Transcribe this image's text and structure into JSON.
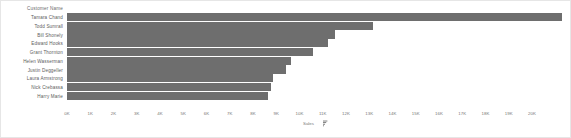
{
  "card": {
    "border_color": "#e6e6e6",
    "background": "#ffffff"
  },
  "header": {
    "label": "Customer Name"
  },
  "axis": {
    "title": "Sales",
    "sort_icon": "sort-descending-icon",
    "ticks": [
      "0K",
      "1K",
      "2K",
      "3K",
      "4K",
      "5K",
      "6K",
      "7K",
      "8K",
      "9K",
      "10K",
      "11K",
      "12K",
      "13K",
      "14K",
      "15K",
      "16K",
      "17K",
      "18K",
      "19K",
      "20K"
    ]
  },
  "chart_data": {
    "type": "bar",
    "orientation": "horizontal",
    "title": "",
    "xlabel": "Sales",
    "ylabel": "Customer Name",
    "xlim": [
      0,
      20000
    ],
    "grid": false,
    "legend": null,
    "bar_color": "#6e6e6e",
    "categories": [
      "Tamara Chand",
      "Todd Sumrall",
      "Bill Shonely",
      "Edward Hooks",
      "Grant Thornton",
      "Helen Wasserman",
      "Justin Deggeller",
      "Laura Armstrong",
      "Nick Crebassa",
      "Harry Marie"
    ],
    "values": [
      19900,
      12300,
      10800,
      10500,
      9900,
      9000,
      8800,
      8300,
      8200,
      8100
    ]
  }
}
